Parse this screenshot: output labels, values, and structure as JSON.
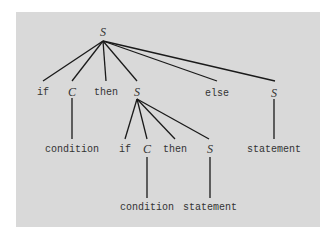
{
  "diagram": {
    "background_color": "#d9d9d9",
    "line_color": "#1a1a1a",
    "text_color": "#333333",
    "nodes": {
      "root": "S",
      "l1_if": "if",
      "l1_c": "C",
      "l1_then": "then",
      "l1_s": "S",
      "l1_else": "else",
      "l1_s2": "S",
      "l2_condition": "condition",
      "l2_if": "if",
      "l2_c": "C",
      "l2_then": "then",
      "l2_s": "S",
      "l2_statement": "statement",
      "l3_condition": "condition",
      "l3_statement": "statement"
    },
    "edges": [
      [
        "root",
        "l1_if"
      ],
      [
        "root",
        "l1_c"
      ],
      [
        "root",
        "l1_then"
      ],
      [
        "root",
        "l1_s"
      ],
      [
        "root",
        "l1_else"
      ],
      [
        "root",
        "l1_s2"
      ],
      [
        "l1_c",
        "l2_condition"
      ],
      [
        "l1_s",
        "l2_if"
      ],
      [
        "l1_s",
        "l2_c"
      ],
      [
        "l1_s",
        "l2_then"
      ],
      [
        "l1_s",
        "l2_s"
      ],
      [
        "l1_s2",
        "l2_statement"
      ],
      [
        "l2_c",
        "l3_condition"
      ],
      [
        "l2_s",
        "l3_statement"
      ]
    ]
  }
}
